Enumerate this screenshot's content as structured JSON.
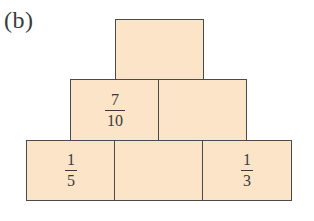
{
  "figure": {
    "label": "(b)",
    "fill_color": "#fce4c8",
    "border_color": "#4a4a4a",
    "text_color": "#3a3a3a"
  },
  "pyramid": {
    "rows": [
      {
        "name": "top",
        "bricks": [
          {
            "position": "top-center",
            "value": null
          }
        ]
      },
      {
        "name": "middle",
        "bricks": [
          {
            "position": "middle-left",
            "value": {
              "numerator": "7",
              "denominator": "10"
            }
          },
          {
            "position": "middle-right",
            "value": null
          }
        ]
      },
      {
        "name": "bottom",
        "bricks": [
          {
            "position": "bottom-left",
            "value": {
              "numerator": "1",
              "denominator": "5"
            }
          },
          {
            "position": "bottom-center",
            "value": null
          },
          {
            "position": "bottom-right",
            "value": {
              "numerator": "1",
              "denominator": "3"
            }
          }
        ]
      }
    ]
  }
}
